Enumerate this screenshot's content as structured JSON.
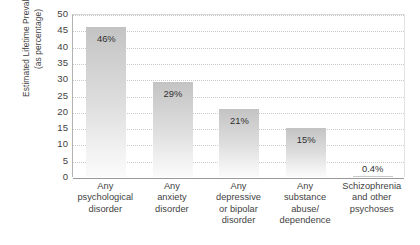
{
  "chart_data": {
    "type": "bar",
    "title": "",
    "subtitle": "",
    "xlabel": "",
    "ylabel": "Estimated Lifetime Prevalence (as percentage)",
    "ylabel_lines": [
      "Estimated Lifetime Prevalence",
      "(as percentage)"
    ],
    "ylim": [
      0,
      50
    ],
    "ytick_step": 5,
    "ytick_labels": [
      "50",
      "45",
      "40",
      "35",
      "30",
      "25",
      "20",
      "15",
      "10",
      "5",
      "0"
    ],
    "ytick_values": [
      50,
      45,
      40,
      35,
      30,
      25,
      20,
      15,
      10,
      5,
      0
    ],
    "grid": true,
    "grid_axis": "y",
    "grid_style": "dotted",
    "legend": false,
    "legend_position": "none",
    "categories": [
      "Any psychological disorder",
      "Any anxiety disorder",
      "Any depressive or bipolar disorder",
      "Any substance abuse/ dependence",
      "Schizophrenia and other psychoses"
    ],
    "category_lines": [
      [
        "Any",
        "psychological",
        "disorder"
      ],
      [
        "Any",
        "anxiety",
        "disorder"
      ],
      [
        "Any",
        "depressive",
        "or bipolar",
        "disorder"
      ],
      [
        "Any",
        "substance",
        "abuse/",
        "dependence"
      ],
      [
        "Schizophrenia",
        "and other",
        "psychoses"
      ]
    ],
    "values": [
      46,
      29,
      21,
      15,
      0.4
    ],
    "data_labels": [
      "46%",
      "29%",
      "21%",
      "15%",
      "0.4%"
    ],
    "label_placement": [
      "inside",
      "inside",
      "inside",
      "inside",
      "outside"
    ],
    "bar_color_top": "#c3c3c3",
    "bar_color_bottom": "#fbfbfb",
    "axis_color": "#9a9a9a",
    "grid_color": "#c9c9c9",
    "text_color": "#3f3f3f",
    "background": "#ffffff"
  }
}
